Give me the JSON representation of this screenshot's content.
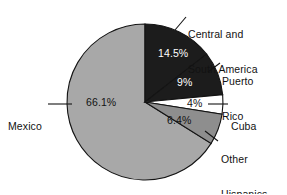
{
  "chart_data": {
    "type": "pie",
    "title": "",
    "subtitle": "",
    "xlabel": "",
    "ylabel": "",
    "legend_position": "callout-labels",
    "grid": false,
    "start_angle_deg": 0,
    "direction": "clockwise",
    "categories": [
      "Central and South America",
      "Puerto Rico",
      "Cuba",
      "Other Hispanics",
      "Mexico"
    ],
    "values": [
      14.5,
      9,
      4,
      6.4,
      66.1
    ],
    "value_labels": [
      "14.5%",
      "9%",
      "4%",
      "6.4%",
      "66.1%"
    ],
    "slices": [
      {
        "label": "Central and South America",
        "label_line1": "Central and",
        "label_line2": "South America",
        "value": 14.5,
        "value_label": "14.5%",
        "fill": "#1c1c1c",
        "text_color": "#ffffff"
      },
      {
        "label": "Puerto Rico",
        "label_line1": "Puerto",
        "label_line2": "Rico",
        "value": 9,
        "value_label": "9%",
        "fill": "#1c1c1c",
        "text_color": "#ffffff"
      },
      {
        "label": "Cuba",
        "label_line1": "Cuba",
        "label_line2": "",
        "value": 4,
        "value_label": "4%",
        "fill": "#ffffff",
        "text_color": "#121212"
      },
      {
        "label": "Other Hispanics",
        "label_line1": "Other",
        "label_line2": "Hispanics",
        "value": 6.4,
        "value_label": "6.4%",
        "fill": "#8e8e8e",
        "text_color": "#121212"
      },
      {
        "label": "Mexico",
        "label_line1": "Mexico",
        "label_line2": "",
        "value": 66.1,
        "value_label": "66.1%",
        "fill": "#a8a8a8",
        "text_color": "#121212"
      }
    ],
    "colors": {
      "dark_slice": "#1c1c1c",
      "white_slice": "#ffffff",
      "mid_gray_slice": "#8e8e8e",
      "light_gray_slice": "#a8a8a8",
      "outline": "#141414",
      "background": "#ffffff",
      "text": "#121212"
    }
  }
}
